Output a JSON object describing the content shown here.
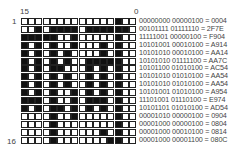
{
  "labels": {
    "top_left": "15",
    "top_right": "0",
    "row_first": "1",
    "row_last": "16"
  },
  "rows": [
    {
      "bits": "0000000000000100",
      "text": "00000000 00000100 = 0004"
    },
    {
      "bits": "0010111101111110",
      "text": "00101111 01111110 = 2F7E"
    },
    {
      "bits": "1111100100000100",
      "text": "11111001 00000100 = F904"
    },
    {
      "bits": "1010100100010100",
      "text": "10101001 00010100 = A914"
    },
    {
      "bits": "1010101000010100",
      "text": "10101010 00010100 = AA14"
    },
    {
      "bits": "1010101001111100",
      "text": "10101010 01111100 = AA7C"
    },
    {
      "bits": "1010110001010100",
      "text": "10101100 01010100 = AC54"
    },
    {
      "bits": "1010101001010100",
      "text": "10101010 01010100 = AA54"
    },
    {
      "bits": "1010101001010100",
      "text": "10101010 01010100 = AA54"
    },
    {
      "bits": "1010100101010100",
      "text": "10101001 01010100 = A954"
    },
    {
      "bits": "1110100101110100",
      "text": "11101001 01110100 = E974"
    },
    {
      "bits": "1010110101010100",
      "text": "10101101 01010100 = AD54"
    },
    {
      "bits": "0000100100000100",
      "text": "00001010 00000100 = 0904"
    },
    {
      "bits": "0000100000000100",
      "text": "00001000 00000100 = 0804"
    },
    {
      "bits": "0000100000010100",
      "text": "00001000 00010100 = 0814"
    },
    {
      "bits": "0000100000001100",
      "text": "00001000 00001100 = 080C"
    }
  ]
}
